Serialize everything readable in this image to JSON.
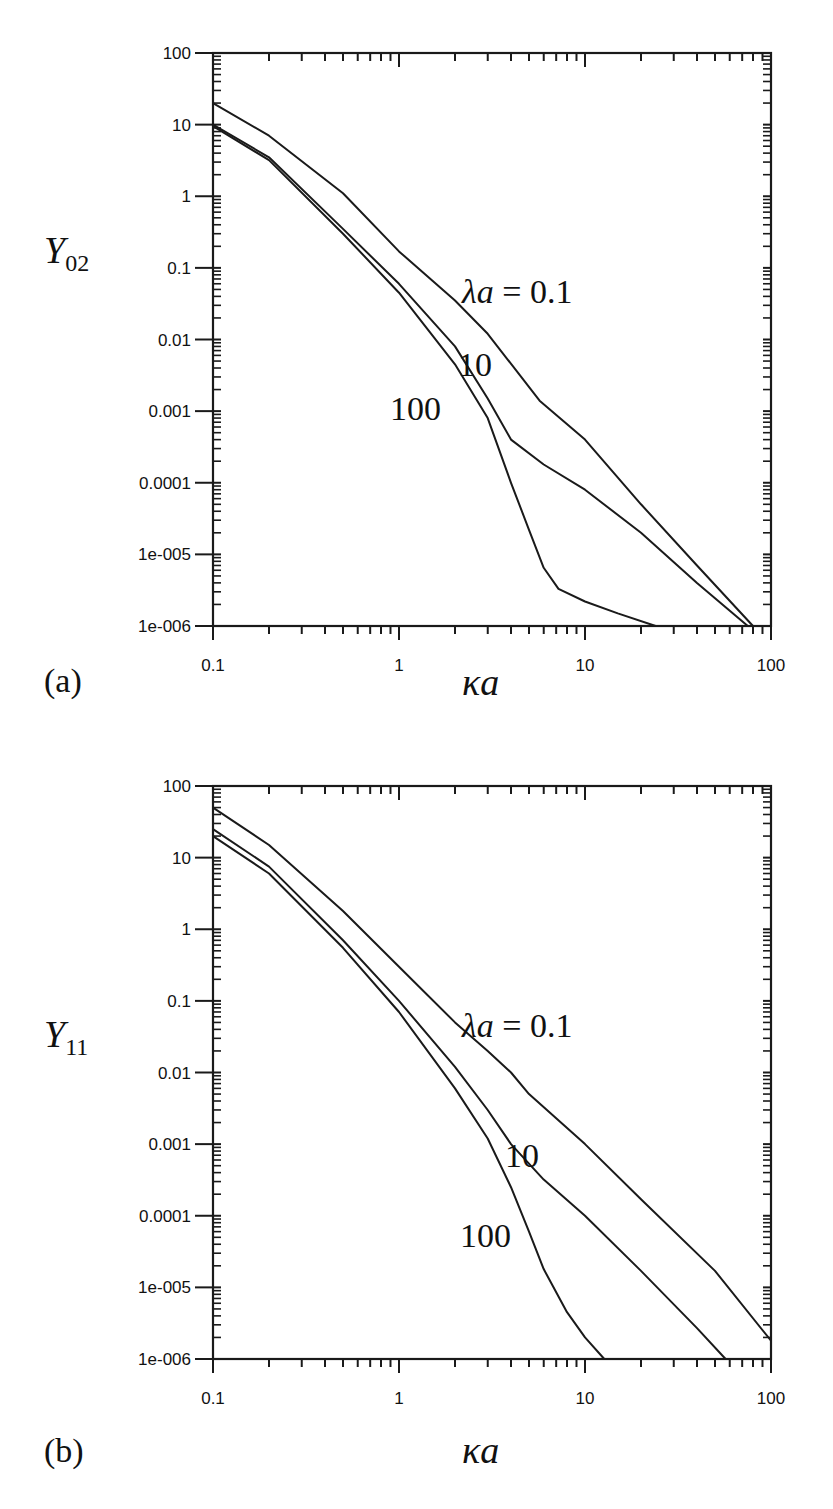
{
  "chart_data": [
    {
      "type": "line",
      "panel_label": "(a)",
      "title": "",
      "xlabel": "κa",
      "ylabel": "Y",
      "ylabel_subscript": "02",
      "xscale": "log",
      "yscale": "log",
      "xlim": [
        0.1,
        100
      ],
      "ylim": [
        1e-06,
        100
      ],
      "x_tick_labels": [
        "0.1",
        "1",
        "10",
        "100"
      ],
      "y_tick_labels": [
        "100",
        "10",
        "1",
        "0.1",
        "0.01",
        "0.001",
        "0.0001",
        "1e-005",
        "1e-006"
      ],
      "grid": false,
      "legend": "inline curve labels",
      "series": [
        {
          "name": "λa = 0.1",
          "label_text": "λa = 0.1",
          "x": [
            0.1,
            0.2,
            0.5,
            1,
            2,
            3,
            5.7,
            10,
            20,
            40,
            80
          ],
          "y": [
            20,
            7,
            1.1,
            0.17,
            0.035,
            0.012,
            0.0014,
            0.0004,
            5e-05,
            7e-06,
            1e-06
          ]
        },
        {
          "name": "λa = 10",
          "label_text": "10",
          "x": [
            0.1,
            0.2,
            0.5,
            1,
            2,
            3,
            4,
            6,
            10,
            20,
            40,
            75
          ],
          "y": [
            10,
            3.5,
            0.35,
            0.06,
            0.008,
            0.0015,
            0.0004,
            0.00018,
            8e-05,
            2e-05,
            4e-06,
            1e-06
          ]
        },
        {
          "name": "λa = 100",
          "label_text": "100",
          "x": [
            0.1,
            0.2,
            0.5,
            1,
            2,
            3,
            4,
            5,
            6,
            7.2,
            10,
            15,
            24
          ],
          "y": [
            9.5,
            3.2,
            0.3,
            0.045,
            0.0045,
            0.0008,
            0.0001,
            2.2e-05,
            6.5e-06,
            3.3e-06,
            2.2e-06,
            1.5e-06,
            1e-06
          ]
        }
      ]
    },
    {
      "type": "line",
      "panel_label": "(b)",
      "title": "",
      "xlabel": "κa",
      "ylabel": "Y",
      "ylabel_subscript": "11",
      "xscale": "log",
      "yscale": "log",
      "xlim": [
        0.1,
        100
      ],
      "ylim": [
        1e-06,
        100
      ],
      "x_tick_labels": [
        "0.1",
        "1",
        "10",
        "100"
      ],
      "y_tick_labels": [
        "100",
        "10",
        "1",
        "0.1",
        "0.01",
        "0.001",
        "0.0001",
        "1e-005",
        "1e-006"
      ],
      "grid": false,
      "legend": "inline curve labels",
      "series": [
        {
          "name": "λa = 0.1",
          "label_text": "λa = 0.1",
          "x": [
            0.1,
            0.2,
            0.5,
            1,
            2,
            3,
            4,
            5,
            10,
            20,
            50,
            100
          ],
          "y": [
            50,
            15,
            1.8,
            0.3,
            0.05,
            0.02,
            0.01,
            0.005,
            0.001,
            0.00017,
            1.7e-05,
            1.8e-06
          ]
        },
        {
          "name": "λa = 10",
          "label_text": "10",
          "x": [
            0.1,
            0.2,
            0.5,
            1,
            2,
            3,
            4,
            6,
            10,
            20,
            40,
            57
          ],
          "y": [
            25,
            7.5,
            0.7,
            0.1,
            0.012,
            0.003,
            0.001,
            0.00032,
            0.0001,
            1.7e-05,
            2.7e-06,
            1e-06
          ]
        },
        {
          "name": "λa = 100",
          "label_text": "100",
          "x": [
            0.1,
            0.2,
            0.5,
            1,
            2,
            3,
            4,
            5,
            6,
            8,
            10,
            12.7
          ],
          "y": [
            20,
            6,
            0.55,
            0.07,
            0.006,
            0.0012,
            0.00025,
            6e-05,
            1.8e-05,
            4.5e-06,
            2e-06,
            1e-06
          ]
        }
      ]
    }
  ],
  "panels": {
    "a": {
      "tag": "(a)",
      "xlabel": "κa",
      "ylabel_main": "Y",
      "ylabel_sub": "02",
      "curve_labels": [
        "λa = 0.1",
        "10",
        "100"
      ]
    },
    "b": {
      "tag": "(b)",
      "xlabel": "κa",
      "ylabel_main": "Y",
      "ylabel_sub": "11",
      "curve_labels": [
        "λa = 0.1",
        "10",
        "100"
      ]
    }
  },
  "style": {
    "line_color": "#1a1a1a",
    "background": "#ffffff"
  }
}
